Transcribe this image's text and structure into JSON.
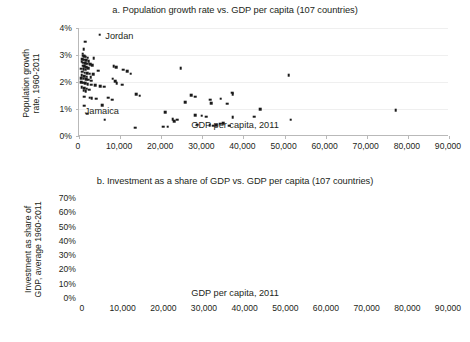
{
  "chart_data": [
    {
      "id": "a",
      "type": "scatter",
      "title": "a. Population growth rate vs. GDP per capita (107 countries)",
      "xlabel": "GDP per capita, 2011",
      "ylabel": "Population growth rate, 1960-2011",
      "ylabel_line1": "Population growth",
      "ylabel_line2": "rate, 1960-2011",
      "xlim": [
        0,
        90000
      ],
      "ylim": [
        0,
        4
      ],
      "xticks": [
        0,
        10000,
        20000,
        30000,
        40000,
        50000,
        60000,
        70000,
        80000,
        90000
      ],
      "xtick_labels": [
        "0",
        "10,000",
        "20,000",
        "30,000",
        "40,000",
        "50,000",
        "60,000",
        "70,000",
        "80,000",
        "90,000"
      ],
      "yticks": [
        0,
        1,
        2,
        3,
        4
      ],
      "ytick_labels": [
        "0%",
        "1%",
        "2%",
        "3%",
        "4%"
      ],
      "grid": true,
      "legend": "none",
      "annotations": [
        {
          "text": "Jordan",
          "x": 6400,
          "y": 3.72
        },
        {
          "text": "Jamaica",
          "x": 1400,
          "y": 0.92
        }
      ],
      "points": [
        [
          5000,
          3.75
        ],
        [
          1500,
          3.5
        ],
        [
          1100,
          3.22
        ],
        [
          900,
          3.05
        ],
        [
          1000,
          2.98
        ],
        [
          1300,
          2.95
        ],
        [
          1600,
          2.93
        ],
        [
          2100,
          2.9
        ],
        [
          3600,
          2.88
        ],
        [
          800,
          2.85
        ],
        [
          1200,
          2.82
        ],
        [
          1800,
          2.8
        ],
        [
          2400,
          2.78
        ],
        [
          700,
          2.75
        ],
        [
          1000,
          2.72
        ],
        [
          1500,
          2.7
        ],
        [
          2000,
          2.68
        ],
        [
          2700,
          2.66
        ],
        [
          3200,
          2.62
        ],
        [
          900,
          2.6
        ],
        [
          1300,
          2.58
        ],
        [
          1700,
          2.55
        ],
        [
          2200,
          2.52
        ],
        [
          600,
          2.5
        ],
        [
          1100,
          2.47
        ],
        [
          1600,
          2.45
        ],
        [
          4600,
          2.42
        ],
        [
          8400,
          2.58
        ],
        [
          9000,
          2.55
        ],
        [
          10800,
          2.45
        ],
        [
          11700,
          2.4
        ],
        [
          12600,
          2.3
        ],
        [
          800,
          2.38
        ],
        [
          1400,
          2.35
        ],
        [
          2000,
          2.32
        ],
        [
          2600,
          2.3
        ],
        [
          3400,
          2.28
        ],
        [
          700,
          2.25
        ],
        [
          1200,
          2.22
        ],
        [
          1900,
          2.2
        ],
        [
          2800,
          2.18
        ],
        [
          24700,
          2.52
        ],
        [
          51000,
          2.25
        ],
        [
          600,
          2.15
        ],
        [
          1100,
          2.12
        ],
        [
          1700,
          2.1
        ],
        [
          2300,
          2.08
        ],
        [
          3000,
          2.05
        ],
        [
          8200,
          2.12
        ],
        [
          8800,
          2.02
        ],
        [
          500,
          2.0
        ],
        [
          1000,
          1.98
        ],
        [
          1500,
          1.95
        ],
        [
          2100,
          1.92
        ],
        [
          2900,
          1.9
        ],
        [
          4000,
          1.88
        ],
        [
          5200,
          1.85
        ],
        [
          6100,
          1.82
        ],
        [
          700,
          1.8
        ],
        [
          1300,
          1.78
        ],
        [
          1900,
          1.75
        ],
        [
          2500,
          1.72
        ],
        [
          9200,
          1.95
        ],
        [
          10500,
          1.9
        ],
        [
          13900,
          1.55
        ],
        [
          14800,
          1.5
        ],
        [
          1100,
          1.68
        ],
        [
          1600,
          1.65
        ],
        [
          37200,
          1.6
        ],
        [
          37400,
          1.55
        ],
        [
          27300,
          1.52
        ],
        [
          28200,
          1.45
        ],
        [
          1200,
          1.45
        ],
        [
          2600,
          1.42
        ],
        [
          3100,
          1.4
        ],
        [
          4200,
          1.38
        ],
        [
          7100,
          1.42
        ],
        [
          8100,
          1.35
        ],
        [
          31900,
          1.35
        ],
        [
          34500,
          1.38
        ],
        [
          32200,
          1.22
        ],
        [
          25800,
          1.25
        ],
        [
          36000,
          1.2
        ],
        [
          5600,
          1.15
        ],
        [
          1200,
          1.12
        ],
        [
          44100,
          1.0
        ],
        [
          77000,
          0.95
        ],
        [
          20900,
          0.88
        ],
        [
          2000,
          0.82
        ],
        [
          42600,
          0.72
        ],
        [
          37400,
          0.7
        ],
        [
          28300,
          0.78
        ],
        [
          29800,
          0.75
        ],
        [
          31000,
          0.72
        ],
        [
          51500,
          0.6
        ],
        [
          22800,
          0.62
        ],
        [
          23900,
          0.6
        ],
        [
          23100,
          0.55
        ],
        [
          6300,
          0.6
        ],
        [
          28700,
          0.42
        ],
        [
          31800,
          0.4
        ],
        [
          32600,
          0.38
        ],
        [
          33400,
          0.4
        ],
        [
          34300,
          0.45
        ],
        [
          35100,
          0.48
        ],
        [
          36500,
          0.38
        ],
        [
          20500,
          0.35
        ],
        [
          21600,
          0.35
        ],
        [
          13600,
          0.3
        ]
      ]
    },
    {
      "id": "b",
      "type": "scatter",
      "title": "b. Investment as a share of GDP vs. GDP per capita (107 countries)",
      "xlabel": "GDP per capita, 2011",
      "ylabel": "Investment as share of GDP, average 1960-2011",
      "ylabel_line1": "Investment as share of",
      "ylabel_line2": "GDP, average 1960-2011",
      "xlim": [
        0,
        90000
      ],
      "ylim": [
        0,
        70
      ],
      "xticks": [
        0,
        10000,
        20000,
        30000,
        40000,
        50000,
        60000,
        70000,
        80000,
        90000
      ],
      "xtick_labels": [
        "0",
        "10,000",
        "20,000",
        "30,000",
        "40,000",
        "50,000",
        "60,000",
        "70,000",
        "80,000",
        "90,000"
      ],
      "yticks": [
        0,
        10,
        20,
        30,
        40,
        50,
        60,
        70
      ],
      "ytick_labels": [
        "0%",
        "10%",
        "20%",
        "30%",
        "40%",
        "50%",
        "60%",
        "70%"
      ],
      "grid": true,
      "legend": "none",
      "annotations": [
        {
          "text": "Guinea-Bissau",
          "x": 2100,
          "y": 43
        },
        {
          "text": "Singapore",
          "x": 53500,
          "y": 44
        }
      ],
      "points": [
        [
          4200,
          58
        ],
        [
          800,
          43
        ],
        [
          51000,
          44
        ],
        [
          23900,
          41.5
        ],
        [
          27300,
          38
        ],
        [
          900,
          30.5
        ],
        [
          2000,
          30
        ],
        [
          3000,
          29.5
        ],
        [
          4600,
          31
        ],
        [
          31000,
          31.5
        ],
        [
          31900,
          31.5
        ],
        [
          44100,
          31
        ],
        [
          33100,
          31
        ],
        [
          51500,
          29.5
        ],
        [
          12800,
          31.5
        ],
        [
          11200,
          29
        ],
        [
          9900,
          28
        ],
        [
          13100,
          27
        ],
        [
          1200,
          27
        ],
        [
          26100,
          26
        ],
        [
          28400,
          30
        ],
        [
          29300,
          30
        ],
        [
          30200,
          26
        ],
        [
          33800,
          30
        ],
        [
          34600,
          28
        ],
        [
          35400,
          27
        ],
        [
          36300,
          27
        ],
        [
          37100,
          27
        ],
        [
          77000,
          27
        ],
        [
          25300,
          25
        ],
        [
          24600,
          25
        ],
        [
          600,
          25
        ],
        [
          1100,
          24
        ],
        [
          1700,
          23
        ],
        [
          2400,
          23
        ],
        [
          3300,
          24
        ],
        [
          4100,
          21
        ],
        [
          5100,
          24
        ],
        [
          6100,
          24
        ],
        [
          7000,
          23
        ],
        [
          7900,
          22
        ],
        [
          8700,
          21
        ],
        [
          9500,
          18
        ],
        [
          10300,
          19
        ],
        [
          11100,
          23
        ],
        [
          11900,
          22
        ],
        [
          12500,
          22
        ],
        [
          13200,
          21
        ],
        [
          13900,
          19
        ],
        [
          14600,
          19
        ],
        [
          15200,
          19
        ],
        [
          500,
          21
        ],
        [
          900,
          20
        ],
        [
          1400,
          19
        ],
        [
          1900,
          18
        ],
        [
          2500,
          19
        ],
        [
          3100,
          18
        ],
        [
          3700,
          17
        ],
        [
          4400,
          17
        ],
        [
          5000,
          18
        ],
        [
          5700,
          17
        ],
        [
          6400,
          18
        ],
        [
          7200,
          19
        ],
        [
          8000,
          20
        ],
        [
          8800,
          18
        ],
        [
          9600,
          17
        ],
        [
          10400,
          19
        ],
        [
          26500,
          22
        ],
        [
          27900,
          26
        ],
        [
          29000,
          25
        ],
        [
          30500,
          24
        ],
        [
          31400,
          24
        ],
        [
          32300,
          25
        ],
        [
          33000,
          25
        ],
        [
          34000,
          24
        ],
        [
          34800,
          24
        ],
        [
          35600,
          24
        ],
        [
          36400,
          24
        ],
        [
          37200,
          24
        ],
        [
          42200,
          21
        ],
        [
          400,
          16
        ],
        [
          800,
          15
        ],
        [
          1200,
          14
        ],
        [
          1600,
          14
        ],
        [
          2100,
          15
        ],
        [
          2600,
          16
        ],
        [
          3200,
          15
        ],
        [
          3800,
          14
        ],
        [
          4500,
          14
        ],
        [
          5300,
          15
        ],
        [
          6200,
          16
        ],
        [
          7100,
          15
        ],
        [
          9200,
          14
        ],
        [
          10700,
          14
        ],
        [
          12200,
          17
        ],
        [
          13500,
          17
        ],
        [
          300,
          12
        ],
        [
          700,
          11
        ],
        [
          1100,
          11
        ],
        [
          1500,
          12
        ],
        [
          1900,
          13
        ],
        [
          2400,
          12
        ],
        [
          2900,
          11
        ],
        [
          3500,
          12
        ],
        [
          9700,
          11
        ],
        [
          20100,
          13
        ],
        [
          20600,
          11
        ],
        [
          20900,
          9.5
        ],
        [
          600,
          9
        ],
        [
          1000,
          8
        ],
        [
          1400,
          7
        ],
        [
          1800,
          10
        ],
        [
          2200,
          9
        ],
        [
          2700,
          10
        ],
        [
          3600,
          10
        ],
        [
          39800,
          18
        ]
      ]
    }
  ]
}
